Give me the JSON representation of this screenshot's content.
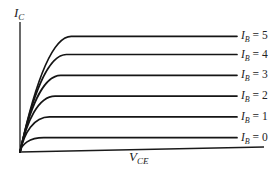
{
  "chart_data": {
    "type": "line",
    "title": "",
    "xlabel": "V",
    "xlabel_sub": "CE",
    "ylabel": "I",
    "ylabel_sub": "C",
    "grid": false,
    "ticks": false,
    "legend": "inline-right",
    "series": [
      {
        "name": "I_B = 0",
        "param_symbol": "I",
        "param_sub": "B",
        "param_value": "0",
        "saturation_level": 0.11
      },
      {
        "name": "I_B = 1",
        "param_symbol": "I",
        "param_sub": "B",
        "param_value": "1",
        "saturation_level": 0.27
      },
      {
        "name": "I_B = 2",
        "param_symbol": "I",
        "param_sub": "B",
        "param_value": "2",
        "saturation_level": 0.43
      },
      {
        "name": "I_B = 3",
        "param_symbol": "I",
        "param_sub": "B",
        "param_value": "3",
        "saturation_level": 0.59
      },
      {
        "name": "I_B = 4",
        "param_symbol": "I",
        "param_sub": "B",
        "param_value": "4",
        "saturation_level": 0.75
      },
      {
        "name": "I_B = 5",
        "param_symbol": "I",
        "param_sub": "B",
        "param_value": "5",
        "saturation_level": 0.89
      }
    ]
  }
}
